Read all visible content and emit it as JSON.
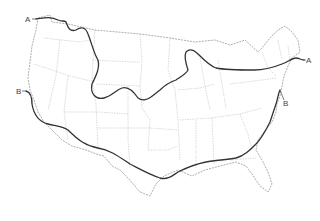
{
  "map": {
    "subject": "Contiguous United States outline map with two boundary lines",
    "lines": [
      {
        "id": "A",
        "label_west": "A",
        "label_east": "A",
        "description": "Northern line from Washington coast across northern states to Maine"
      },
      {
        "id": "B",
        "label_west": "B",
        "label_east": "B",
        "description": "Southern line from California coast across southern states to mid-Atlantic"
      }
    ],
    "labels": {
      "a_west": "A",
      "a_east": "A",
      "b_west": "B",
      "b_east": "B"
    },
    "colors": {
      "background": "#ffffff",
      "boundary_lines": "#333333",
      "state_borders": "#b5b5b5",
      "country_outline": "#8a8a8a"
    }
  }
}
